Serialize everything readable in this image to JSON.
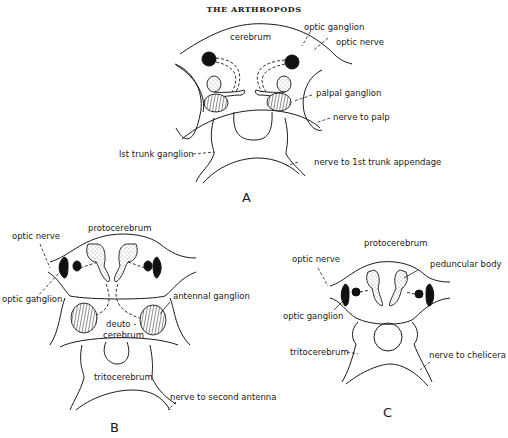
{
  "header": {
    "title": "THE ARTHROPODS"
  },
  "panels": {
    "A": {
      "letter": "A",
      "labels": {
        "cerebrum": "cerebrum",
        "optic_ganglion": "optic ganglion",
        "optic_nerve": "optic nerve",
        "palpal_ganglion": "palpal ganglion",
        "nerve_to_palp": "nerve to palp",
        "first_trunk_ganglion": "lst trunk ganglion",
        "nerve_to_first_trunk_appendage": "nerve to 1st trunk appendage"
      }
    },
    "B": {
      "letter": "B",
      "labels": {
        "protocerebrum": "protocerebrum",
        "optic_nerve": "optic nerve",
        "optic_ganglion": "optic ganglion",
        "antennal_ganglion": "antennal ganglion",
        "deutocerebrum_1": "deuto -",
        "deutocerebrum_2": "cerebrum",
        "tritocerebrum": "tritocerebrum",
        "nerve_to_second_antenna": "nerve to second antenna"
      }
    },
    "C": {
      "letter": "C",
      "labels": {
        "protocerebrum": "protocerebrum",
        "optic_nerve": "optic nerve",
        "peduncular_body": "peduncular body",
        "optic_ganglion": "optic ganglion",
        "tritocerebrum": "tritocerebrum",
        "nerve_to_chelicera": "nerve to chelicera"
      }
    }
  }
}
